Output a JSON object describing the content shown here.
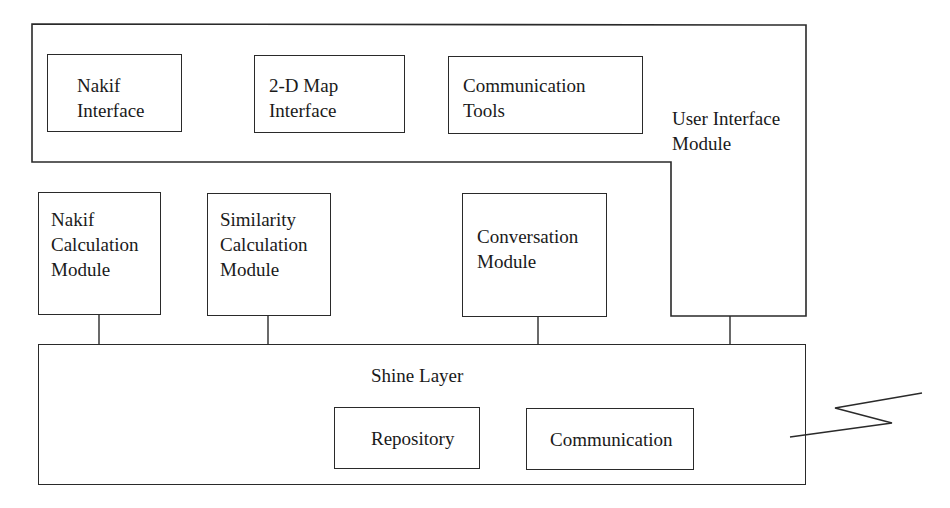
{
  "diagram": {
    "user_interface_module": {
      "label": "User Interface\nModule",
      "children": [
        {
          "id": "nakif-interface",
          "label": "Nakif\nInterface"
        },
        {
          "id": "map-interface",
          "label": "2-D Map\nInterface"
        },
        {
          "id": "communication-tools",
          "label": "Communication\nTools"
        }
      ]
    },
    "modules": [
      {
        "id": "nakif-calculation-module",
        "label": "Nakif\nCalculation\nModule"
      },
      {
        "id": "similarity-calculation-module",
        "label": "Similarity\nCalculation\nModule"
      },
      {
        "id": "conversation-module",
        "label": "Conversation\nModule"
      }
    ],
    "shine_layer": {
      "label": "Shine Layer",
      "children": [
        {
          "id": "repository",
          "label": "Repository"
        },
        {
          "id": "communication",
          "label": "Communication"
        }
      ]
    },
    "connections": [
      {
        "from": "nakif-calculation-module",
        "to": "shine-layer"
      },
      {
        "from": "similarity-calculation-module",
        "to": "shine-layer"
      },
      {
        "from": "conversation-module",
        "to": "shine-layer"
      },
      {
        "from": "user-interface-module",
        "to": "shine-layer"
      },
      {
        "from": "communication",
        "to": "external-wireless-link"
      }
    ]
  }
}
